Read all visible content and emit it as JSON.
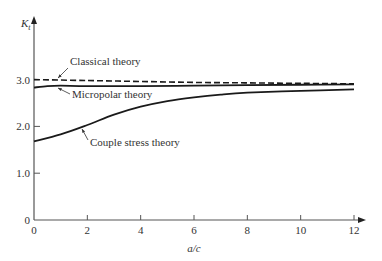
{
  "chart_data": {
    "type": "line",
    "title": "",
    "xlabel": "a/c",
    "ylabel": "K_t",
    "ylabel_main": "K",
    "ylabel_sub": "t",
    "xlim": [
      0,
      12
    ],
    "ylim": [
      0,
      3.5
    ],
    "grid": false,
    "legend": "none (inline annotations with leader arrows)",
    "xticks": [
      0,
      2,
      4,
      6,
      8,
      10,
      12
    ],
    "xtick_labels": [
      "0",
      "2",
      "4",
      "6",
      "8",
      "10",
      "12"
    ],
    "yticks": [
      0,
      1.0,
      2.0,
      3.0
    ],
    "ytick_labels": [
      "0",
      "1.0",
      "2.0",
      "3.0"
    ],
    "series": [
      {
        "name": "Classical theory",
        "style": "dashed",
        "x": [
          0,
          2,
          4,
          6,
          8,
          10,
          12
        ],
        "y": [
          3.0,
          2.98,
          2.96,
          2.94,
          2.93,
          2.92,
          2.91
        ]
      },
      {
        "name": "Micropolar theory",
        "style": "solid",
        "x": [
          0,
          0.5,
          1,
          2,
          4,
          6,
          8,
          10,
          12
        ],
        "y": [
          2.83,
          2.86,
          2.87,
          2.86,
          2.86,
          2.87,
          2.88,
          2.89,
          2.9
        ]
      },
      {
        "name": "Couple stress theory",
        "style": "solid",
        "x": [
          0,
          1,
          2,
          3,
          4,
          5,
          6,
          7,
          8,
          10,
          12
        ],
        "y": [
          1.68,
          1.83,
          2.03,
          2.25,
          2.42,
          2.54,
          2.62,
          2.68,
          2.72,
          2.76,
          2.79
        ]
      }
    ],
    "annotations": [
      {
        "text": "Classical theory",
        "points_to_series": "Classical theory"
      },
      {
        "text": "Micropolar theory",
        "points_to_series": "Micropolar theory"
      },
      {
        "text": "Couple stress theory",
        "points_to_series": "Couple stress theory"
      }
    ]
  },
  "layout": {
    "plot_px": {
      "x0": 34,
      "x1": 354,
      "y0": 220,
      "y_per_unit": 46.8
    },
    "axis_arrow_top": 16,
    "axis_arrow_right": 366,
    "line_color": "#1a1a1a",
    "axis_color": "#555555"
  }
}
